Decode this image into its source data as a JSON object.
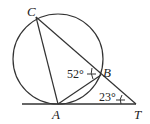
{
  "diagram": {
    "type": "geometry",
    "points": {
      "C": {
        "label": "C"
      },
      "B": {
        "label": "B"
      },
      "A": {
        "label": "A"
      },
      "T": {
        "label": "T"
      }
    },
    "angles": {
      "angle_at_B": "52°",
      "angle_at_T": "23°"
    },
    "colors": {
      "stroke": "#333333",
      "background": "#ffffff"
    }
  }
}
